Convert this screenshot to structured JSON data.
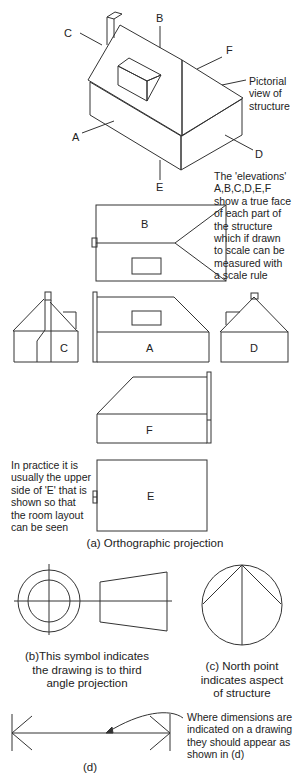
{
  "pictorial": {
    "labels": {
      "A": "A",
      "B": "B",
      "C": "C",
      "D": "D",
      "E": "E",
      "F": "F"
    },
    "note": "Pictorial\nview of\nstructure"
  },
  "elevations_note": "The 'elevations'\nA,B,C,D,E,F\nshow a true face\nof each part of\nthe structure\nwhich if drawn\nto scale can be\nmeasured with\na scale rule",
  "orthographic": {
    "labels": {
      "B": "B",
      "C": "C",
      "A": "A",
      "D": "D",
      "F": "F",
      "E": "E"
    },
    "e_note": "In practice it is\nusually the upper\nside of 'E' that is\nshown so that\nthe room layout\ncan be seen",
    "caption": "(a) Orthographic projection"
  },
  "third_angle": {
    "caption": "(b)This symbol indicates\nthe drawing is to third\nangle projection"
  },
  "north_point": {
    "caption": "(c) North point\nindicates aspect\nof structure"
  },
  "dimension": {
    "note": "Where dimensions are\nindicated on a drawing\nthey should appear as\nshown in (d)",
    "caption": "(d)"
  }
}
